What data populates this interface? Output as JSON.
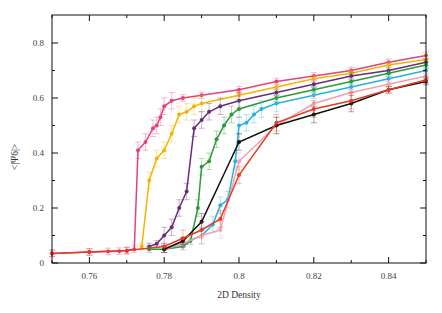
{
  "header": {
    "caption_fragment": ""
  },
  "chart_data": {
    "type": "line",
    "title": "",
    "xlabel": "2D Density",
    "ylabel": "<|Ψ6|>",
    "xlim": [
      0.75,
      0.85
    ],
    "ylim": [
      0,
      0.9
    ],
    "xticks": [
      0.76,
      0.78,
      0.8,
      0.82,
      0.84
    ],
    "xtick_labels": [
      "0.76",
      "0.78",
      "0.8",
      "0.82",
      "0.84"
    ],
    "yticks": [
      0,
      0.2,
      0.4,
      0.6,
      0.8
    ],
    "ytick_labels": [
      "0",
      "0.2",
      "0.4",
      "0.6",
      "0.8"
    ],
    "grid": false,
    "legend": null,
    "series": [
      {
        "name": "pink",
        "color": "#e8407a",
        "x": [
          0.75,
          0.76,
          0.765,
          0.768,
          0.77,
          0.772,
          0.773,
          0.775,
          0.777,
          0.778,
          0.779,
          0.78,
          0.782,
          0.785,
          0.79,
          0.8,
          0.81,
          0.82,
          0.83,
          0.84,
          0.85
        ],
        "y": [
          0.035,
          0.04,
          0.042,
          0.043,
          0.045,
          0.05,
          0.41,
          0.44,
          0.49,
          0.5,
          0.53,
          0.57,
          0.59,
          0.6,
          0.61,
          0.63,
          0.66,
          0.68,
          0.7,
          0.73,
          0.755
        ]
      },
      {
        "name": "orange",
        "color": "#f5b400",
        "x": [
          0.774,
          0.776,
          0.778,
          0.78,
          0.782,
          0.784,
          0.786,
          0.788,
          0.79,
          0.8,
          0.81,
          0.82,
          0.83,
          0.84,
          0.85
        ],
        "y": [
          0.06,
          0.3,
          0.38,
          0.41,
          0.47,
          0.54,
          0.55,
          0.57,
          0.58,
          0.61,
          0.64,
          0.67,
          0.69,
          0.72,
          0.74
        ]
      },
      {
        "name": "purple",
        "color": "#6a2c7a",
        "x": [
          0.776,
          0.778,
          0.78,
          0.782,
          0.784,
          0.786,
          0.788,
          0.79,
          0.792,
          0.795,
          0.8,
          0.81,
          0.82,
          0.83,
          0.84,
          0.85
        ],
        "y": [
          0.06,
          0.07,
          0.1,
          0.13,
          0.2,
          0.26,
          0.49,
          0.52,
          0.55,
          0.57,
          0.59,
          0.62,
          0.65,
          0.68,
          0.7,
          0.73
        ]
      },
      {
        "name": "green",
        "color": "#2a9a3a",
        "x": [
          0.776,
          0.78,
          0.785,
          0.787,
          0.789,
          0.79,
          0.792,
          0.794,
          0.796,
          0.798,
          0.8,
          0.81,
          0.82,
          0.83,
          0.84,
          0.85
        ],
        "y": [
          0.05,
          0.05,
          0.06,
          0.08,
          0.2,
          0.35,
          0.37,
          0.45,
          0.5,
          0.54,
          0.56,
          0.6,
          0.63,
          0.66,
          0.69,
          0.72
        ]
      },
      {
        "name": "cyan",
        "color": "#2ab0e0",
        "x": [
          0.78,
          0.785,
          0.79,
          0.793,
          0.795,
          0.797,
          0.799,
          0.8,
          0.802,
          0.804,
          0.806,
          0.81,
          0.82,
          0.83,
          0.84,
          0.85
        ],
        "y": [
          0.05,
          0.07,
          0.1,
          0.14,
          0.21,
          0.23,
          0.37,
          0.5,
          0.51,
          0.54,
          0.56,
          0.58,
          0.61,
          0.64,
          0.67,
          0.7
        ]
      },
      {
        "name": "light-pink",
        "color": "#f2a0b0",
        "x": [
          0.78,
          0.785,
          0.79,
          0.795,
          0.8,
          0.81,
          0.82,
          0.83,
          0.84,
          0.85
        ],
        "y": [
          0.05,
          0.07,
          0.1,
          0.12,
          0.37,
          0.5,
          0.58,
          0.62,
          0.65,
          0.68
        ]
      },
      {
        "name": "black",
        "color": "#111111",
        "x": [
          0.78,
          0.785,
          0.79,
          0.8,
          0.81,
          0.82,
          0.83,
          0.84,
          0.85
        ],
        "y": [
          0.05,
          0.08,
          0.15,
          0.44,
          0.5,
          0.54,
          0.58,
          0.63,
          0.66
        ]
      },
      {
        "name": "red",
        "color": "#e83a20",
        "x": [
          0.75,
          0.76,
          0.77,
          0.78,
          0.785,
          0.79,
          0.795,
          0.8,
          0.81,
          0.82,
          0.83,
          0.84,
          0.85
        ],
        "y": [
          0.035,
          0.04,
          0.045,
          0.06,
          0.09,
          0.12,
          0.16,
          0.32,
          0.51,
          0.56,
          0.59,
          0.63,
          0.665
        ]
      }
    ]
  }
}
